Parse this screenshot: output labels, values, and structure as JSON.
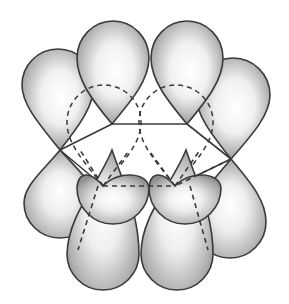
{
  "figure": {
    "colors": {
      "background": "#ffffff",
      "outline": "#3a3a3a",
      "lobe_dark": "#8c8c8c",
      "lobe_light": "#ffffff"
    },
    "ring": {
      "vertices": [
        {
          "id": "C1",
          "x": 60,
          "y": 150,
          "position": "left"
        },
        {
          "id": "C2",
          "x": 112,
          "y": 124,
          "position": "back-left"
        },
        {
          "id": "C3",
          "x": 187,
          "y": 124,
          "position": "back-right"
        },
        {
          "id": "C4",
          "x": 231,
          "y": 159,
          "position": "right"
        },
        {
          "id": "C5",
          "x": 175,
          "y": 186,
          "position": "front-right"
        },
        {
          "id": "C6",
          "x": 103,
          "y": 186,
          "position": "front-left"
        }
      ],
      "hidden_edges": [
        "C5-C6"
      ]
    },
    "orbitals": [
      {
        "atom": "C1",
        "upper_lobe": "visible",
        "lower_lobe": "visible"
      },
      {
        "atom": "C2",
        "upper_lobe": "visible",
        "lower_lobe": "visible"
      },
      {
        "atom": "C3",
        "upper_lobe": "visible",
        "lower_lobe": "visible"
      },
      {
        "atom": "C4",
        "upper_lobe": "visible",
        "lower_lobe": "visible"
      },
      {
        "atom": "C5",
        "upper_lobe": "hidden",
        "lower_lobe": "visible"
      },
      {
        "atom": "C6",
        "upper_lobe": "hidden",
        "lower_lobe": "visible"
      }
    ]
  }
}
